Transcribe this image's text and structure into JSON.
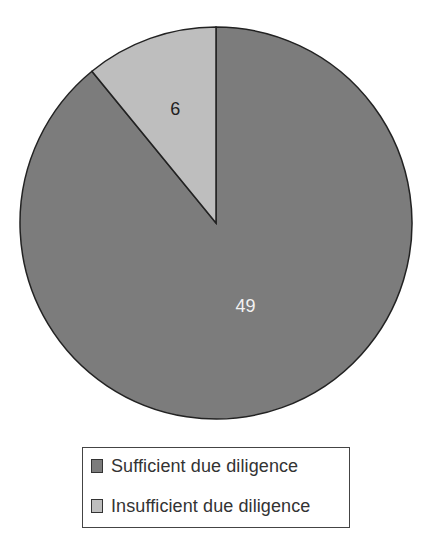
{
  "chart_data": {
    "type": "pie",
    "title": "",
    "slices": [
      {
        "label": "Sufficient due diligence",
        "value": 49,
        "color": "#7c7c7c",
        "label_color": "#f2f2f2"
      },
      {
        "label": "Insufficient due diligence",
        "value": 6,
        "color": "#bebebe",
        "label_color": "#222222"
      }
    ],
    "data_labels": [
      "49",
      "6"
    ],
    "start_angle_deg": 0,
    "direction": "clockwise",
    "legend": {
      "position": "bottom",
      "entries": [
        "Sufficient due diligence",
        "Insufficient due diligence"
      ]
    }
  }
}
